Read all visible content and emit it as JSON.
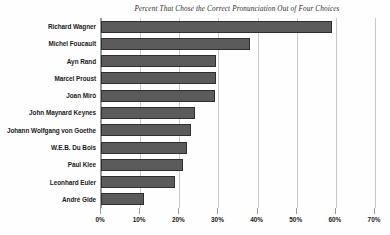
{
  "chart_data": {
    "type": "bar",
    "orientation": "horizontal",
    "title": "Percent That Chose the Correct Pronunciation Out of Four Choices",
    "subtitle": "",
    "xlabel": "",
    "ylabel": "",
    "xlim": [
      0,
      70
    ],
    "ylim": null,
    "grid": true,
    "grid_axis": "x",
    "legend": false,
    "legend_position": "none",
    "bar_color": "#5b5b5b",
    "bar_edge_color": "#2e2e2e",
    "background_color": "#fefefe",
    "gridline_color": "#c8c8c8",
    "axis_color": "#9a9a9a",
    "categories": [
      "Richard Wagner",
      "Michel Foucault",
      "Ayn Rand",
      "Marcel Proust",
      "Joan Miró",
      "John Maynard Keynes",
      "Johann Wolfgang von Goethe",
      "W.E.B. Du Bois",
      "Paul Klee",
      "Leonhard Euler",
      "André Gide"
    ],
    "values": [
      59,
      38,
      29.5,
      29.5,
      29,
      24,
      23,
      22,
      21,
      19,
      11
    ],
    "xtick_values": [
      0,
      10,
      20,
      30,
      40,
      50,
      60,
      70
    ],
    "xtick_labels": [
      "0%",
      "10%",
      "20%",
      "30%",
      "40%",
      "50%",
      "60%",
      "70%"
    ],
    "annotations": []
  }
}
